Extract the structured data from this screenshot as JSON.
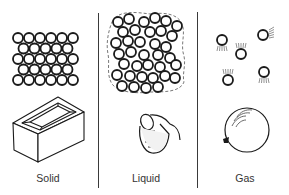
{
  "diagram": {
    "panels": [
      {
        "id": "solid",
        "label": "Solid",
        "particle_view": "closely packed regular lattice (rows of 6,5,6,5,6)",
        "example": "brick"
      },
      {
        "id": "liquid",
        "label": "Liquid",
        "particle_view": "closely packed irregular cluster",
        "example": "pouring jug"
      },
      {
        "id": "gas",
        "label": "Gas",
        "particle_view": "widely spaced moving particles (5)",
        "example": "balloon"
      }
    ],
    "colors": {
      "ink": "#1a1a1a",
      "background": "#ffffff",
      "label": "#333333"
    }
  }
}
